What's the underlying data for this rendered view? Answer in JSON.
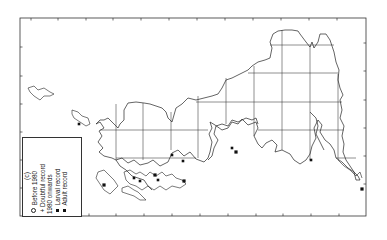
{
  "figure": {
    "panel_label": "(c)",
    "orientation": "rotated 90° counter-clockwise",
    "frame": {
      "x": 20,
      "y": 18,
      "width": 346,
      "height": 198
    },
    "grid": {
      "vertical_x": [
        116,
        143,
        171,
        198,
        226,
        254,
        282,
        310,
        338
      ],
      "horizontal_y": [
        45,
        73,
        102,
        130,
        158
      ]
    },
    "ticks": {
      "top_x": [
        31,
        58,
        86,
        113,
        141,
        169,
        197,
        225,
        253,
        281,
        309,
        337
      ],
      "bottom_x": [
        33,
        61,
        89,
        116,
        144,
        172,
        200,
        228,
        256,
        283,
        311,
        339
      ],
      "left_y": [
        47,
        76,
        104,
        132,
        160,
        188
      ],
      "right_y": [
        43,
        71,
        100,
        128,
        156,
        184
      ]
    },
    "colors": {
      "ink": "#222222",
      "background": "#ffffff",
      "record": "#111111"
    }
  },
  "legend": {
    "title": "(c)",
    "items": [
      {
        "symbol": "circle-open",
        "label": "Before 1980"
      },
      {
        "symbol": "plus",
        "label": "Doubtful record"
      },
      {
        "symbol": "none",
        "label": "1980 onwards"
      },
      {
        "symbol": "square-filled",
        "label": "Larval record"
      },
      {
        "symbol": "square-filled",
        "label": "Adult record"
      }
    ]
  },
  "records": [
    {
      "type": "adult",
      "x": 104,
      "y": 185
    },
    {
      "type": "larval",
      "x": 134,
      "y": 178
    },
    {
      "type": "larval",
      "x": 140,
      "y": 181
    },
    {
      "type": "adult",
      "x": 155,
      "y": 175
    },
    {
      "type": "larval",
      "x": 158,
      "y": 180
    },
    {
      "type": "larval",
      "x": 183,
      "y": 161
    },
    {
      "type": "adult",
      "x": 184,
      "y": 181
    },
    {
      "type": "larval",
      "x": 232,
      "y": 148
    },
    {
      "type": "adult",
      "x": 236,
      "y": 152
    },
    {
      "type": "larval",
      "x": 311,
      "y": 160
    },
    {
      "type": "adult",
      "x": 362,
      "y": 189
    },
    {
      "type": "larval",
      "x": 79,
      "y": 124
    },
    {
      "type": "larval",
      "x": 172,
      "y": 155
    }
  ]
}
